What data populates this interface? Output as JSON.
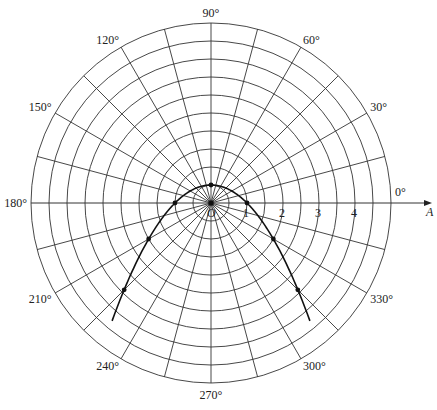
{
  "chart_data": {
    "type": "line",
    "coordinate_system": "polar",
    "title": "",
    "equation": "r = 1 / (1 + sin θ)",
    "polar_axis_label": "A",
    "pole_label": "O",
    "radial_ticks": [
      1,
      2,
      3,
      4
    ],
    "radial_ring_step": 0.5,
    "radial_max": 5,
    "angle_step_deg": 15,
    "angle_labels": [
      "0°",
      "30°",
      "60°",
      "90°",
      "120°",
      "150°",
      "180°",
      "210°",
      "240°",
      "270°",
      "300°",
      "330°"
    ],
    "angle_label_values": [
      0,
      30,
      60,
      90,
      120,
      150,
      180,
      210,
      240,
      270,
      300,
      330
    ],
    "curve_theta_range_deg": [
      -50,
      230
    ],
    "points": [
      {
        "theta": 0,
        "r": 1
      },
      {
        "theta": 90,
        "r": 0.5
      },
      {
        "theta": 180,
        "r": 1
      },
      {
        "theta": 210,
        "r": 2
      },
      {
        "theta": 225,
        "r": 3.41
      },
      {
        "theta": 315,
        "r": 3.41
      },
      {
        "theta": 330,
        "r": 2
      }
    ],
    "grid": true
  },
  "layout": {
    "center_x": 211,
    "center_y": 203,
    "outer_radius": 180,
    "unit_px": 36,
    "line_color": "#333333",
    "curve_color": "#111111"
  }
}
